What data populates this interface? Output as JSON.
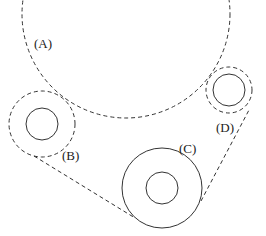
{
  "diagram": {
    "type": "belt-pulley diagram",
    "labels": {
      "a": "(A)",
      "b": "(B)",
      "c": "(C)",
      "d": "(D)"
    },
    "stroke_color": "#333333",
    "circles": [
      {
        "id": "A",
        "cx": 126,
        "cy": 14,
        "r": 104,
        "style": "dashed"
      },
      {
        "id": "B",
        "cx": 42,
        "cy": 124,
        "r_outer": 33,
        "r_inner": 16,
        "outer_style": "dashed"
      },
      {
        "id": "C",
        "cx": 162,
        "cy": 188,
        "r_outer": 40,
        "r_inner": 16,
        "outer_style": "solid"
      },
      {
        "id": "D",
        "cx": 229,
        "cy": 90,
        "r_outer": 23,
        "r_inner": 16,
        "outer_style": "dashed"
      }
    ]
  }
}
